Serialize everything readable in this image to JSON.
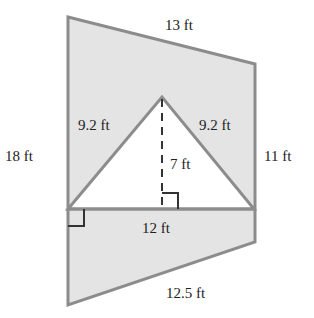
{
  "diagram": {
    "type": "composite-figure",
    "colors": {
      "fill": "#e4e4e4",
      "stroke": "#8c8c8c",
      "text": "#222222",
      "cutout": "#ffffff"
    },
    "labels": {
      "top": "13 ft",
      "left": "18 ft",
      "right": "11 ft",
      "bottom": "12.5 ft",
      "triangle_left": "9.2 ft",
      "triangle_right": "9.2 ft",
      "triangle_height": "7 ft",
      "triangle_base": "12 ft"
    }
  }
}
